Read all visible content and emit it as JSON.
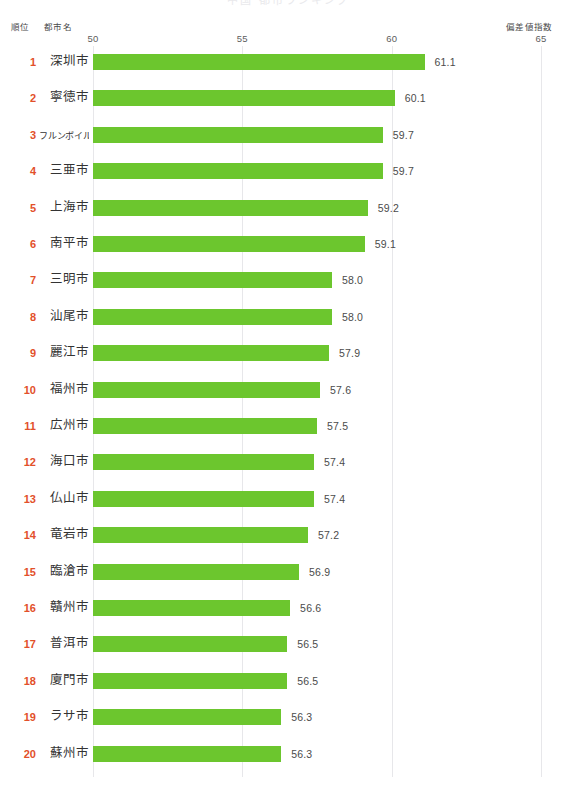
{
  "title": {
    "clipped_text": "中国 都市ランキング"
  },
  "headers": {
    "rank": "順位",
    "city": "都市名",
    "index": "偏差値指数"
  },
  "colors": {
    "bar": "#6cc62e",
    "rank_text": "#e2502a",
    "gridline": "#e7e7ea",
    "value_text": "#4b4b4b",
    "background": "#ffffff"
  },
  "axis": {
    "ticks": [
      50,
      55,
      60,
      65
    ],
    "tick_labels": [
      "50",
      "55",
      "60",
      "65"
    ],
    "min": 50,
    "max": 65
  },
  "chart_data": {
    "type": "bar",
    "orientation": "horizontal",
    "title": "中国 都市ランキング",
    "xlabel": "偏差値指数",
    "ylabel": "都市名",
    "xlim": [
      50,
      65
    ],
    "grid": true,
    "legend": "none",
    "value_format": "one-decimal",
    "categories": [
      "深圳市",
      "寧徳市",
      "フルンボイル市",
      "三亜市",
      "上海市",
      "南平市",
      "三明市",
      "汕尾市",
      "麗江市",
      "福州市",
      "広州市",
      "海口市",
      "仏山市",
      "竜岩市",
      "臨滄市",
      "贛州市",
      "普洱市",
      "廈門市",
      "ラサ市",
      "蘇州市"
    ],
    "values": [
      61.1,
      60.1,
      59.7,
      59.7,
      59.2,
      59.1,
      58.0,
      58.0,
      57.9,
      57.6,
      57.5,
      57.4,
      57.4,
      57.2,
      56.9,
      56.6,
      56.5,
      56.5,
      56.3,
      56.3
    ],
    "ranks": [
      1,
      2,
      3,
      4,
      5,
      6,
      7,
      8,
      9,
      10,
      11,
      12,
      13,
      14,
      15,
      16,
      17,
      18,
      19,
      20
    ],
    "value_labels": [
      "61.1",
      "60.1",
      "59.7",
      "59.7",
      "59.2",
      "59.1",
      "58.0",
      "58.0",
      "57.9",
      "57.6",
      "57.5",
      "57.4",
      "57.4",
      "57.2",
      "56.9",
      "56.6",
      "56.5",
      "56.5",
      "56.3",
      "56.3"
    ]
  }
}
